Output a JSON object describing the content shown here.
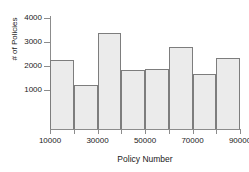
{
  "chart_data": {
    "type": "bar",
    "title": "",
    "subtitle": "",
    "xlabel": "Policy Number",
    "ylabel": "# of Policies",
    "grid": false,
    "legend": null,
    "bin_edges": [
      10000,
      20000,
      30000,
      40000,
      50000,
      60000,
      70000,
      80000,
      90000
    ],
    "bin_width": 10000,
    "categories": [
      "10000-20000",
      "20000-30000",
      "30000-40000",
      "40000-50000",
      "50000-60000",
      "60000-70000",
      "70000-80000",
      "80000-90000"
    ],
    "values": [
      2260,
      1220,
      3380,
      1850,
      1890,
      2800,
      1650,
      2330
    ],
    "xlim": [
      10000,
      90000
    ],
    "ylim": [
      0,
      4200
    ],
    "xticks": [
      10000,
      30000,
      50000,
      70000,
      90000
    ],
    "xtick_labels": [
      "10000",
      "30000",
      "50000",
      "70000",
      "90000"
    ],
    "yticks": [
      1000,
      2000,
      3000,
      4000
    ],
    "ytick_labels": [
      "1000",
      "2000",
      "3000",
      "4000"
    ],
    "bar_fill_color": "#ebebeb",
    "bar_edge_color": "#7d7d7d",
    "axis_color": "#8c8c8c",
    "text_color": "#1a1a1a",
    "background_color": "#ffffff"
  }
}
